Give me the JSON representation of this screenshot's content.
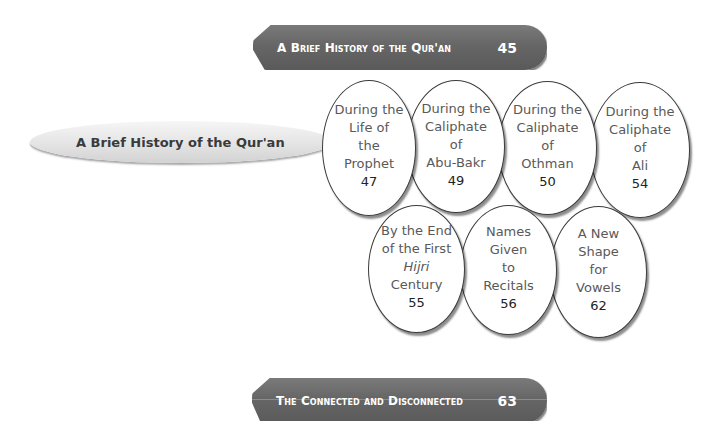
{
  "top_chapter": {
    "title": "A Brief History of the Qur'an",
    "page": "45"
  },
  "section": {
    "title": "A Brief History of the Qur'an",
    "page": "47"
  },
  "subsections_row1": [
    {
      "line1": "During the",
      "line2": "Life of",
      "line3": "the",
      "line4": "Prophet",
      "page": "47"
    },
    {
      "line1": "During the",
      "line2": "Caliphate",
      "line3": "of",
      "line4": "Abu-Bakr",
      "page": "49"
    },
    {
      "line1": "During the",
      "line2": "Caliphate",
      "line3": "of",
      "line4": "Othman",
      "page": "50"
    },
    {
      "line1": "During the",
      "line2": "Caliphate",
      "line3": "of",
      "line4": "Ali",
      "page": "54"
    }
  ],
  "subsections_row2": [
    {
      "line1": "By the End",
      "line2": "of the First",
      "line3": "Hijri",
      "line4": "Century",
      "page": "55"
    },
    {
      "line1": "Names",
      "line2": "Given",
      "line3": "to",
      "line4": "Recitals",
      "page": "56"
    },
    {
      "line1": "A New",
      "line2": "Shape",
      "line3": "for",
      "line4": "Vowels",
      "page": "62"
    }
  ],
  "next_chapter": {
    "title": "The Connected and Disconnected",
    "page": "63"
  }
}
